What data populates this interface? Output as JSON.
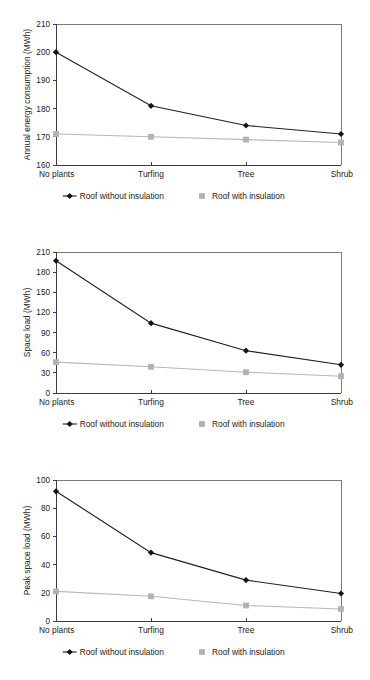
{
  "figure": {
    "categories": [
      "No plants",
      "Turfing",
      "Tree",
      "Shrub"
    ],
    "legend": {
      "series_dark_label": "Roof without insulation",
      "series_light_label": "Roof with insulation",
      "marker_dark": "diamond",
      "marker_light": "square"
    },
    "colors": {
      "series_dark": "#141414",
      "series_light": "#b2b2b2",
      "frame": "#7a7a7a",
      "axis": "#3d3d3d",
      "background": "#ffffff"
    }
  },
  "chart_data": [
    {
      "type": "line",
      "title": "",
      "xlabel": "",
      "ylabel": "Annual energy consumption (MWh)",
      "categories": [
        "No plants",
        "Turfing",
        "Tree",
        "Shrub"
      ],
      "ylim": [
        160,
        210
      ],
      "yticks": [
        160,
        170,
        180,
        190,
        200,
        210
      ],
      "ytick_labels": [
        "160",
        "170",
        "180",
        "190",
        "200",
        "210"
      ],
      "grid": false,
      "legend_position": "bottom",
      "series": [
        {
          "name": "Roof without insulation",
          "marker": "diamond",
          "color": "#141414",
          "values": [
            200,
            181,
            174,
            171
          ]
        },
        {
          "name": "Roof with insulation",
          "marker": "square",
          "color": "#b2b2b2",
          "values": [
            171,
            170,
            169,
            168
          ]
        }
      ]
    },
    {
      "type": "line",
      "title": "",
      "xlabel": "",
      "ylabel": "Space load (MWh)",
      "categories": [
        "No plants",
        "Turfing",
        "Tree",
        "Shrub"
      ],
      "ylim": [
        0,
        210
      ],
      "yticks": [
        0,
        30,
        60,
        90,
        120,
        150,
        180,
        210
      ],
      "ytick_labels": [
        "0",
        "30",
        "60",
        "90",
        "120",
        "150",
        "180",
        "210"
      ],
      "grid": false,
      "legend_position": "bottom",
      "series": [
        {
          "name": "Roof without insulation",
          "marker": "diamond",
          "color": "#141414",
          "values": [
            197,
            104,
            63,
            42
          ]
        },
        {
          "name": "Roof with insulation",
          "marker": "square",
          "color": "#b2b2b2",
          "values": [
            46,
            39,
            31,
            25
          ]
        }
      ]
    },
    {
      "type": "line",
      "title": "",
      "xlabel": "",
      "ylabel": "Peak space load (MWh)",
      "categories": [
        "No plants",
        "Turfing",
        "Tree",
        "Shrub"
      ],
      "ylim": [
        0,
        100
      ],
      "yticks": [
        0,
        20,
        40,
        60,
        80,
        100
      ],
      "ytick_labels": [
        "0",
        "20",
        "40",
        "60",
        "80",
        "100"
      ],
      "grid": false,
      "legend_position": "bottom",
      "series": [
        {
          "name": "Roof without insulation",
          "marker": "diamond",
          "color": "#141414",
          "values": [
            92,
            48.5,
            29,
            19.5
          ]
        },
        {
          "name": "Roof with insulation",
          "marker": "square",
          "color": "#b2b2b2",
          "values": [
            21,
            17.5,
            11,
            8.5
          ]
        }
      ]
    }
  ]
}
